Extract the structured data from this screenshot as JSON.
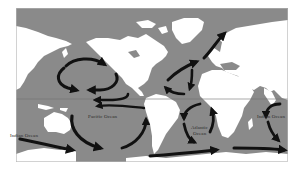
{
  "map": {
    "title": "Ocean surface currents",
    "colors": {
      "ocean": "#8a8a8a",
      "land": "#ffffff",
      "arrows": "#111111",
      "border": "#b5b5b5",
      "equator": "#6e6e6e"
    },
    "labels": {
      "pacific": "Pacific Ocean",
      "indian_west": "Indian Ocean",
      "atlantic_line1": "Atlantic",
      "atlantic_line2": "Ocean",
      "indian_east": "Indian Ocean"
    },
    "currents": [
      {
        "name": "north-pacific-gyre",
        "direction": "clockwise"
      },
      {
        "name": "north-atlantic-gyre",
        "direction": "clockwise"
      },
      {
        "name": "north-atlantic-drift",
        "direction": "northeast"
      },
      {
        "name": "pacific-equatorial-current",
        "direction": "west"
      },
      {
        "name": "south-pacific-gyre",
        "direction": "counterclockwise"
      },
      {
        "name": "south-atlantic-gyre",
        "direction": "counterclockwise"
      },
      {
        "name": "indian-ocean-gyre",
        "direction": "counterclockwise"
      },
      {
        "name": "antarctic-circumpolar-current",
        "direction": "east"
      }
    ]
  }
}
